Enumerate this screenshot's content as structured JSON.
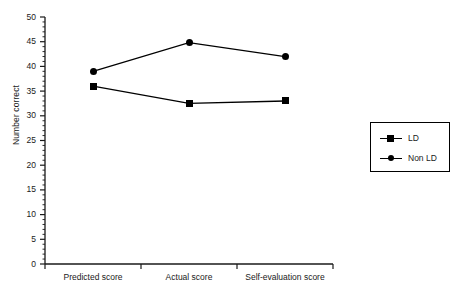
{
  "chart_data": {
    "type": "line",
    "title": "",
    "xlabel": "",
    "ylabel": "Number correct",
    "categories": [
      "Predicted score",
      "Actual score",
      "Self-evaluation score"
    ],
    "series": [
      {
        "name": "LD",
        "marker": "square",
        "values": [
          36,
          32.5,
          33
        ]
      },
      {
        "name": "Non LD",
        "marker": "circle",
        "values": [
          39,
          44.8,
          42
        ]
      }
    ],
    "ylim": [
      0,
      50
    ],
    "ytick_step": 5,
    "yticks": [
      0,
      5,
      10,
      15,
      20,
      25,
      30,
      35,
      40,
      45,
      50
    ],
    "ytick_labels": [
      "0",
      "5",
      "10",
      "15",
      "20",
      "25",
      "30",
      "35",
      "40",
      "45",
      "50"
    ],
    "minor_tick_step": 1,
    "grid": false,
    "legend_position": "right",
    "line_color": "#000000",
    "marker_color": "#000000",
    "background_color": "#ffffff"
  },
  "legend": {
    "entries": [
      {
        "label": "LD",
        "marker": "square-marker"
      },
      {
        "label": "Non LD",
        "marker": "circle-marker"
      }
    ]
  }
}
